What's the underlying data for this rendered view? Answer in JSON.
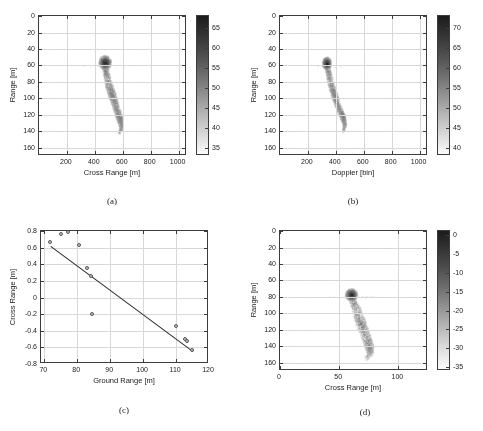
{
  "figure": {
    "panels": [
      {
        "id": "a",
        "caption": "(a)",
        "xlabel": "Cross Range [m]",
        "ylabel": "Range [m]",
        "xticks": [
          "200",
          "400",
          "600",
          "800",
          "1000"
        ],
        "yticks": [
          "0",
          "20",
          "40",
          "60",
          "80",
          "100",
          "120",
          "140",
          "160"
        ],
        "colorbar_ticks": [
          "65",
          "60",
          "55",
          "50",
          "45",
          "40",
          "35"
        ]
      },
      {
        "id": "b",
        "caption": "(b)",
        "xlabel": "Doppler [bin]",
        "ylabel": "Range [m]",
        "xticks": [
          "200",
          "400",
          "600",
          "800",
          "1000"
        ],
        "yticks": [
          "0",
          "20",
          "40",
          "60",
          "80",
          "100",
          "120",
          "140",
          "160"
        ],
        "colorbar_ticks": [
          "70",
          "65",
          "60",
          "55",
          "50",
          "45",
          "40"
        ]
      },
      {
        "id": "c",
        "caption": "(c)",
        "xlabel": "Ground Range [m]",
        "ylabel": "Cross Range [m]",
        "xticks": [
          "70",
          "80",
          "90",
          "100",
          "110",
          "120"
        ],
        "yticks": [
          "0.8",
          "0.6",
          "0.4",
          "0.2",
          "0",
          "-0.2",
          "-0.4",
          "-0.6",
          "-0.8"
        ],
        "colorbar_ticks": []
      },
      {
        "id": "d",
        "caption": "(d)",
        "xlabel": "Cross Range [m]",
        "ylabel": "Range [m]",
        "xticks": [
          "0",
          "50",
          "100"
        ],
        "yticks": [
          "0",
          "20",
          "40",
          "60",
          "80",
          "100",
          "120",
          "140",
          "160"
        ],
        "colorbar_ticks": [
          "0",
          "-5",
          "-10",
          "-15",
          "-20",
          "-25",
          "-30",
          "-35"
        ]
      }
    ]
  },
  "chart_data": [
    {
      "panel": "a",
      "type": "heatmap",
      "title": "",
      "xlabel": "Cross Range [m]",
      "ylabel": "Range [m]",
      "xlim": [
        0,
        1060
      ],
      "ylim": [
        0,
        170
      ],
      "y_inverted": true,
      "xticks": [
        200,
        400,
        600,
        800,
        1000
      ],
      "yticks": [
        0,
        20,
        40,
        60,
        80,
        100,
        120,
        140,
        160
      ],
      "grid": true,
      "colorbar": {
        "label": "",
        "ticks": [
          35,
          40,
          45,
          50,
          55,
          60,
          65
        ],
        "vmin": 33,
        "vmax": 68,
        "colormap": "gray-inverted",
        "dark_is_high": true
      },
      "description": "ISAR radar reflectivity map of an elongated ship-like target; bright compact cluster near cross-range 470 m / range 57 m with a horizontal sidelobe streak across range 60 m, plus a diagonal body extending down-right to about cross-range 590 m / range 130 m."
    },
    {
      "panel": "b",
      "type": "heatmap",
      "title": "",
      "xlabel": "Doppler [bin]",
      "ylabel": "Range [m]",
      "xlim": [
        0,
        1060
      ],
      "ylim": [
        0,
        170
      ],
      "y_inverted": true,
      "xticks": [
        200,
        400,
        600,
        800,
        1000
      ],
      "yticks": [
        0,
        20,
        40,
        60,
        80,
        100,
        120,
        140,
        160
      ],
      "grid": true,
      "colorbar": {
        "label": "",
        "ticks": [
          40,
          45,
          50,
          55,
          60,
          65,
          70
        ],
        "vmin": 38,
        "vmax": 73,
        "colormap": "gray-inverted",
        "dark_is_high": true
      },
      "description": "Range-Doppler map of the same target; compact bright cluster near doppler bin 330 / range 58 m with horizontal streak, body extending to doppler bin 470 / range 128 m."
    },
    {
      "panel": "c",
      "type": "scatter",
      "title": "",
      "xlabel": "Ground Range [m]",
      "ylabel": "Cross Range [m]",
      "xlim": [
        69,
        120
      ],
      "ylim": [
        -0.8,
        0.8
      ],
      "xticks": [
        70,
        80,
        90,
        100,
        110,
        120
      ],
      "yticks": [
        -0.8,
        -0.6,
        -0.4,
        -0.2,
        0,
        0.2,
        0.4,
        0.6,
        0.8
      ],
      "grid": true,
      "points": [
        {
          "x": 71.8,
          "y": 0.67
        },
        {
          "x": 75.2,
          "y": 0.76
        },
        {
          "x": 77.1,
          "y": 0.785
        },
        {
          "x": 80.6,
          "y": 0.63
        },
        {
          "x": 83.0,
          "y": 0.355
        },
        {
          "x": 84.2,
          "y": 0.265
        },
        {
          "x": 84.6,
          "y": -0.2
        },
        {
          "x": 110.0,
          "y": -0.345
        },
        {
          "x": 112.8,
          "y": -0.5
        },
        {
          "x": 113.4,
          "y": -0.525
        },
        {
          "x": 114.8,
          "y": -0.625
        }
      ],
      "fit_line": {
        "name": "linear fit",
        "x_start": 72.0,
        "y_start": 0.625,
        "x_end": 115.2,
        "y_end": -0.64,
        "slope": -0.0293,
        "intercept": 2.734
      },
      "marker": {
        "shape": "circle",
        "face_color": "#c9c9c9",
        "edge_color": "#555555"
      }
    },
    {
      "panel": "d",
      "type": "heatmap",
      "title": "",
      "xlabel": "Cross Range [m]",
      "ylabel": "Range [m]",
      "xlim": [
        0,
        125
      ],
      "ylim": [
        0,
        170
      ],
      "y_inverted": true,
      "xticks": [
        0,
        50,
        100
      ],
      "yticks": [
        0,
        20,
        40,
        60,
        80,
        100,
        120,
        140,
        160
      ],
      "grid": true,
      "colorbar": {
        "label": "",
        "ticks": [
          0,
          -5,
          -10,
          -15,
          -20,
          -25,
          -30,
          -35
        ],
        "vmin": -36,
        "vmax": 1,
        "colormap": "gray-inverted",
        "dark_is_high": true
      },
      "description": "Reconstructed/focused image in metric cross-range; bright cluster near cross-range 60 m / range 78 m with horizontal streak at range 80 m, elongated body extending down to cross-range 76 m / range 145 m."
    }
  ]
}
